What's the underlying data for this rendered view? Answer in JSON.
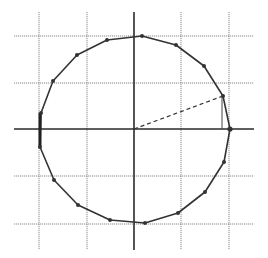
{
  "diagram": {
    "title": "",
    "colors": {
      "background": "#ffffff",
      "grid": "#8a8a8a",
      "axis": "#2a2a2a",
      "polygon": "#333333"
    },
    "grid": {
      "vertical_x": [
        39,
        87,
        134,
        181,
        229
      ],
      "horizontal_y": [
        36,
        83,
        129,
        176,
        224
      ],
      "x_extent": [
        14,
        254
      ],
      "y_extent": [
        12,
        250
      ]
    },
    "axes": {
      "horizontal": {
        "y": 129,
        "x1": 14,
        "x2": 254
      },
      "vertical": {
        "x": 134,
        "y1": 12,
        "y2": 250
      }
    },
    "center": [
      134,
      129
    ],
    "polygon_vertices": [
      [
        230,
        129
      ],
      [
        223,
        96
      ],
      [
        204,
        66
      ],
      [
        176,
        45
      ],
      [
        142,
        36
      ],
      [
        107,
        40
      ],
      [
        77,
        55
      ],
      [
        53,
        81
      ],
      [
        41,
        113
      ],
      [
        40,
        147
      ],
      [
        54,
        180
      ],
      [
        78,
        205
      ],
      [
        110,
        220
      ],
      [
        145,
        223
      ],
      [
        178,
        213
      ],
      [
        205,
        192
      ],
      [
        224,
        162
      ]
    ],
    "radius_line": {
      "from": [
        134,
        129
      ],
      "to": [
        223,
        96
      ]
    },
    "drop_line": {
      "x": 222,
      "y1": 96,
      "y2": 129
    },
    "left_edge_thick": {
      "x": 40,
      "y1": 113,
      "y2": 147
    }
  }
}
